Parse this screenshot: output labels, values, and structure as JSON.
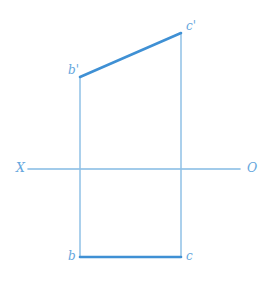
{
  "figure": {
    "background_color": "#ffffff",
    "width": 269,
    "height": 287
  },
  "colors": {
    "object_line": "#3f90d4",
    "projection_line": "#8fc1e6",
    "ground_line": "#84bbe4",
    "label_text": "#64a6dd"
  },
  "ground_axis": {
    "left_label": "X",
    "right_label": "O",
    "y": 169,
    "x_start": 28,
    "x_end": 240,
    "stroke_width": 1.6
  },
  "points": {
    "b_prime": {
      "label": "b'",
      "x": 80,
      "y": 77,
      "label_x": 68,
      "label_y": 64
    },
    "c_prime": {
      "label": "c'",
      "x": 181,
      "y": 33,
      "label_x": 186,
      "label_y": 20
    },
    "b": {
      "label": "b",
      "x": 80,
      "y": 257,
      "label_x": 68,
      "label_y": 250
    },
    "c": {
      "label": "c",
      "x": 181,
      "y": 257,
      "label_x": 186,
      "label_y": 250
    }
  },
  "segments": {
    "frontal_projection": {
      "name": "b'c'",
      "x1": 80,
      "y1": 77,
      "x2": 181,
      "y2": 33,
      "stroke_width": 2.6
    },
    "horizontal_projection": {
      "name": "bc",
      "x1": 80,
      "y1": 257,
      "x2": 181,
      "y2": 257,
      "stroke_width": 2.6
    },
    "connector_left": {
      "name": "b'b",
      "x1": 80,
      "y1": 77,
      "x2": 80,
      "y2": 257,
      "stroke_width": 1.5
    },
    "connector_right": {
      "name": "c'c",
      "x1": 181,
      "y1": 33,
      "x2": 181,
      "y2": 257,
      "stroke_width": 1.5
    }
  }
}
